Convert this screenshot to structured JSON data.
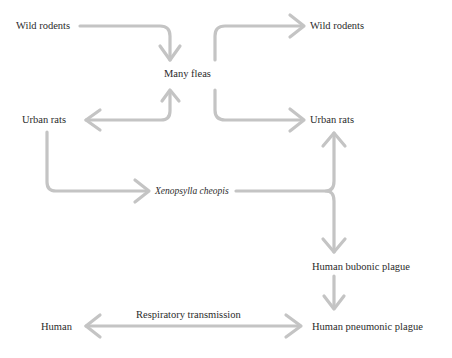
{
  "colors": {
    "arrow": "#c4c4c4",
    "text": "#2b2b2b",
    "background": "#ffffff"
  },
  "nodes": {
    "wild_rodents_left": "Wild rodents",
    "many_fleas": "Many fleas",
    "wild_rodents_right": "Wild rodents",
    "urban_rats_left": "Urban rats",
    "urban_rats_right": "Urban rats",
    "xenopsylla": "Xenopsylla cheopis",
    "human_bubonic": "Human bubonic plague",
    "human": "Human",
    "human_pneumonic": "Human pneumonic plague"
  },
  "edge_labels": {
    "respiratory": "Respiratory transmission"
  },
  "edges": [
    {
      "from": "Wild rodents (left)",
      "to": "Many fleas"
    },
    {
      "from": "Many fleas",
      "to": "Urban rats (left)",
      "bidirectional": true
    },
    {
      "from": "Many fleas",
      "to": "Wild rodents (right)"
    },
    {
      "from": "Many fleas",
      "to": "Urban rats (right)"
    },
    {
      "from": "Urban rats (left)",
      "to": "Xenopsylla cheopis"
    },
    {
      "from": "Xenopsylla cheopis",
      "to": "Urban rats (right)"
    },
    {
      "from": "Xenopsylla cheopis",
      "to": "Human bubonic plague"
    },
    {
      "from": "Human bubonic plague",
      "to": "Human pneumonic plague"
    },
    {
      "from": "Human pneumonic plague",
      "to": "Human",
      "bidirectional": true,
      "label": "Respiratory transmission"
    }
  ]
}
